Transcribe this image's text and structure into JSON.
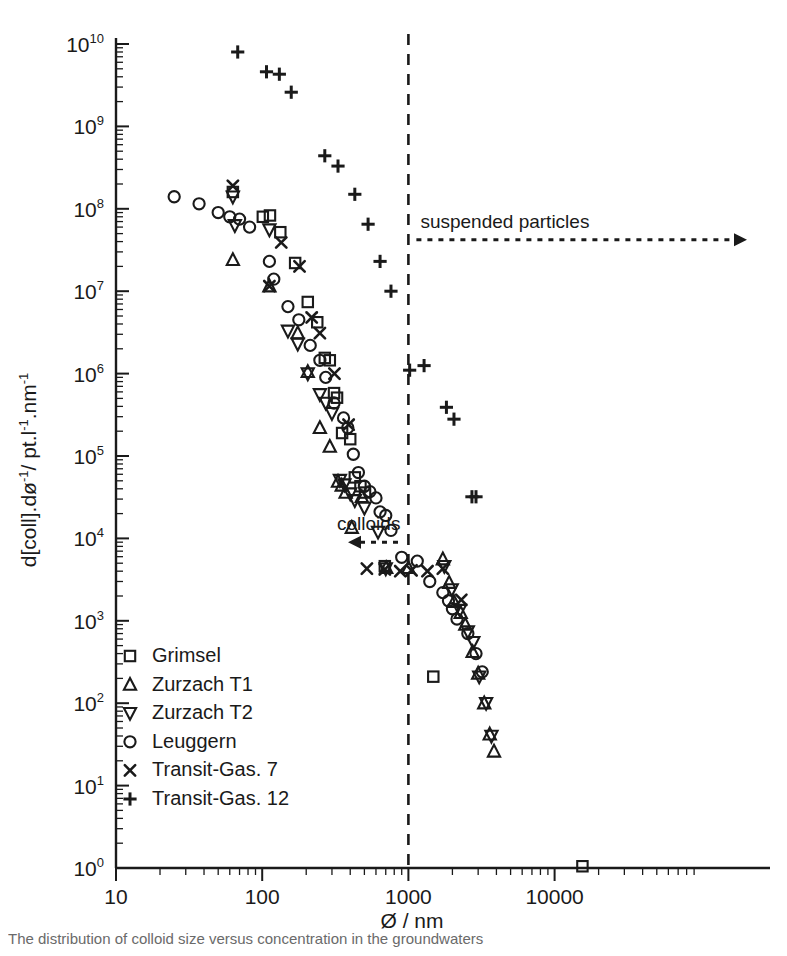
{
  "chart_data": {
    "type": "scatter",
    "title": "",
    "xlabel": "Ø / nm",
    "ylabel": "d[coll].dø⁻¹/ pt.l⁻¹.nm⁻¹",
    "xscale": "log",
    "yscale": "log",
    "xlim": [
      10,
      20000
    ],
    "ylim": [
      1,
      10000000000
    ],
    "xticks": [
      "10",
      "100",
      "1000",
      "10000"
    ],
    "xtickvalues": [
      10,
      100,
      1000,
      10000
    ],
    "yticks": [
      "10⁰",
      "10¹",
      "10²",
      "10³",
      "10⁴",
      "10⁵",
      "10⁶",
      "10⁷",
      "10⁸",
      "10⁹",
      "10¹⁰"
    ],
    "ytickvalues": [
      1,
      10,
      100,
      1000,
      10000,
      100000,
      1000000,
      10000000,
      100000000,
      1000000000,
      10000000000
    ],
    "grid": false,
    "legend_position": "lower-left",
    "series": [
      {
        "name": "Grimsel",
        "marker": "square",
        "points": [
          [
            63,
            160000000.0
          ],
          [
            101,
            80000000.0
          ],
          [
            113,
            83000000.0
          ],
          [
            133,
            52000000.0
          ],
          [
            168,
            22000000.0
          ],
          [
            205,
            7400000.0
          ],
          [
            238,
            4200000.0
          ],
          [
            268,
            1550000.0
          ],
          [
            290,
            1450000.0
          ],
          [
            310,
            580000.0
          ],
          [
            325,
            510000.0
          ],
          [
            352,
            190000.0
          ],
          [
            400,
            160000.0
          ],
          [
            430,
            55000.0
          ],
          [
            470,
            43000.0
          ],
          [
            505,
            36000.0
          ],
          [
            690,
            4600.0
          ],
          [
            1480,
            210.0
          ],
          [
            15500,
            1.05
          ]
        ]
      },
      {
        "name": "Zurzach T1",
        "marker": "triangle-up",
        "points": [
          [
            63,
            24000000.0
          ],
          [
            112,
            11500000.0
          ],
          [
            175,
            3100000.0
          ],
          [
            205,
            1050000.0
          ],
          [
            248,
            220000.0
          ],
          [
            290,
            130000.0
          ],
          [
            330,
            49000.0
          ],
          [
            350,
            44000.0
          ],
          [
            372,
            36000.0
          ],
          [
            410,
            13500.0
          ],
          [
            480,
            32000.0
          ],
          [
            705,
            4400.0
          ],
          [
            1000,
            4400.0
          ],
          [
            1720,
            5600.0
          ],
          [
            1900,
            2900.0
          ],
          [
            2050,
            1700.0
          ],
          [
            2280,
            1250.0
          ],
          [
            2450,
            900.0
          ],
          [
            2750,
            420.0
          ],
          [
            3000,
            230.0
          ],
          [
            3300,
            100.0
          ],
          [
            3600,
            42.0
          ],
          [
            3850,
            26.0
          ]
        ]
      },
      {
        "name": "Zurzach T2",
        "marker": "triangle-down",
        "points": [
          [
            63,
            140000000.0
          ],
          [
            65,
            63000000.0
          ],
          [
            112,
            56000000.0
          ],
          [
            150,
            3300000.0
          ],
          [
            175,
            2300000.0
          ],
          [
            205,
            1000000.0
          ],
          [
            248,
            560000.0
          ],
          [
            272,
            440000.0
          ],
          [
            300,
            330000.0
          ],
          [
            340,
            51000.0
          ],
          [
            365,
            45000.0
          ],
          [
            400,
            35000.0
          ],
          [
            430,
            29000.0
          ],
          [
            500,
            23500.0
          ],
          [
            620,
            12000.0
          ],
          [
            700,
            4300.0
          ],
          [
            1760,
            4600.0
          ],
          [
            1980,
            2400.0
          ],
          [
            2250,
            1350.0
          ],
          [
            2550,
            740.0
          ],
          [
            2780,
            550.0
          ],
          [
            3050,
            210.0
          ],
          [
            3400,
            100.0
          ],
          [
            3700,
            40.0
          ]
        ]
      },
      {
        "name": "Leuggern",
        "marker": "circle",
        "points": [
          [
            25,
            140000000.0
          ],
          [
            37,
            115000000.0
          ],
          [
            50,
            90000000.0
          ],
          [
            60,
            80000000.0
          ],
          [
            70,
            75000000.0
          ],
          [
            82,
            60000000.0
          ],
          [
            112,
            23000000.0
          ],
          [
            120,
            14000000.0
          ],
          [
            150,
            6500000.0
          ],
          [
            178,
            4500000.0
          ],
          [
            213,
            2200000.0
          ],
          [
            248,
            1450000.0
          ],
          [
            272,
            900000.0
          ],
          [
            310,
            440000.0
          ],
          [
            360,
            290000.0
          ],
          [
            385,
            220000.0
          ],
          [
            420,
            105000.0
          ],
          [
            455,
            63000.0
          ],
          [
            500,
            43000.0
          ],
          [
            545,
            37000.0
          ],
          [
            600,
            31000.0
          ],
          [
            640,
            21000.0
          ],
          [
            700,
            19000.0
          ],
          [
            760,
            12500.0
          ],
          [
            900,
            5900.0
          ],
          [
            1150,
            5300.0
          ],
          [
            1400,
            3000.0
          ],
          [
            1720,
            2200.0
          ],
          [
            1880,
            1750.0
          ],
          [
            2000,
            1400.0
          ],
          [
            2150,
            1050.0
          ],
          [
            2550,
            700.0
          ],
          [
            2900,
            400.0
          ],
          [
            3200,
            240.0
          ]
        ]
      },
      {
        "name": "Transit-Gas.  7",
        "marker": "x",
        "points": [
          [
            63,
            190000000.0
          ],
          [
            112,
            11500000.0
          ],
          [
            135,
            39000000.0
          ],
          [
            180,
            20000000.0
          ],
          [
            218,
            4800000.0
          ],
          [
            248,
            3100000.0
          ],
          [
            312,
            1000000.0
          ],
          [
            390,
            240000.0
          ],
          [
            520,
            4300.0
          ],
          [
            690,
            4200.0
          ],
          [
            880,
            4000.0
          ],
          [
            1050,
            4100.0
          ],
          [
            1350,
            4000.0
          ],
          [
            1720,
            4300.0
          ],
          [
            2300,
            1800.0
          ]
        ]
      },
      {
        "name": "Transit-Gas. 12",
        "marker": "plus",
        "points": [
          [
            68,
            8000000000.0
          ],
          [
            107,
            4600000000.0
          ],
          [
            131,
            4300000000.0
          ],
          [
            158,
            2600000000.0
          ],
          [
            268,
            440000000.0
          ],
          [
            330,
            330000000.0
          ],
          [
            430,
            150000000.0
          ],
          [
            530,
            65000000.0
          ],
          [
            640,
            23000000.0
          ],
          [
            760,
            10000000.0
          ],
          [
            1020,
            1100000.0
          ],
          [
            1280,
            1250000.0
          ],
          [
            1820,
            390000.0
          ],
          [
            2050,
            280000.0
          ],
          [
            2720,
            32000.0
          ],
          [
            2900,
            32000.0
          ]
        ]
      }
    ],
    "annotations": [
      {
        "id": "suspended-particles",
        "text": "suspended particles",
        "direction": "right",
        "x_start": 1000,
        "y": 42000000.0
      },
      {
        "id": "colloids",
        "text": "colloids",
        "direction": "left",
        "x_end": 1000,
        "y": 9000.0
      }
    ],
    "reference_line": {
      "id": "colloid-suspended-boundary",
      "orientation": "vertical",
      "x": 1000,
      "style": "dashed"
    }
  },
  "legend": {
    "items": [
      {
        "marker": "square",
        "label": "Grimsel"
      },
      {
        "marker": "triangle-up",
        "label": "Zurzach T1"
      },
      {
        "marker": "triangle-down",
        "label": "Zurzach T2"
      },
      {
        "marker": "circle",
        "label": "Leuggern"
      },
      {
        "marker": "x",
        "label": "Transit-Gas.  7"
      },
      {
        "marker": "plus",
        "label": "Transit-Gas. 12"
      }
    ]
  },
  "axes": {
    "x_title": "Ø / nm",
    "y_title_parts": {
      "p1": "d[coll].d",
      "p2": "ø",
      "sup1": "-1",
      "p3": "/ pt.l",
      "sup2": "-1",
      "p4": ".nm",
      "sup3": "-1"
    }
  },
  "caption": {
    "text": "The distribution of colloid size versus concentration in the groundwaters"
  },
  "colors": {
    "ink": "#1a1a1a",
    "background": "#ffffff",
    "caption": "#6a6a6a"
  }
}
